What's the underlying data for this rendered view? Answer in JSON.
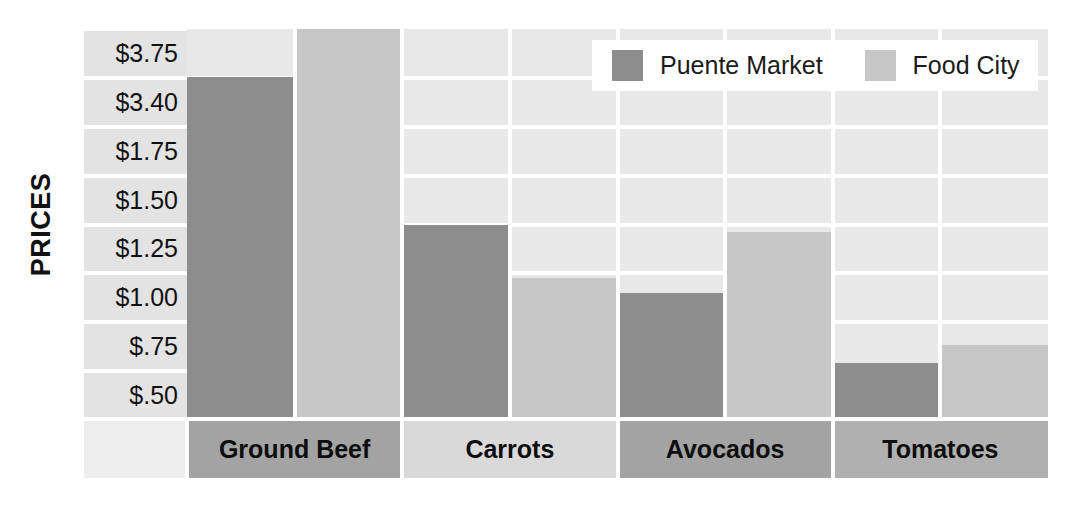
{
  "axis": {
    "y_title": "PRICES",
    "y_ticks": [
      "$3.75",
      "$3.40",
      "$1.75",
      "$1.50",
      "$1.25",
      "$1.00",
      "$.75",
      "$.50"
    ]
  },
  "legend": {
    "items": [
      {
        "label": "Puente Market",
        "color": "#8d8d8d",
        "swatch_name": "legend-swatch-puente-market"
      },
      {
        "label": "Food City",
        "color": "#c6c6c6",
        "swatch_name": "legend-swatch-food-city"
      }
    ]
  },
  "colors": {
    "series_puente_market": "#8d8d8d",
    "series_food_city": "#c6c6c6",
    "plot_background": "#e8e8e8",
    "tick_band": "#e3e3e3",
    "gridline": "#ffffff",
    "text": "#111111"
  },
  "categories": [
    "Ground Beef",
    "Carrots",
    "Avocados",
    "Tomatoes"
  ],
  "chart_data": {
    "type": "bar",
    "title": "",
    "xlabel": "",
    "ylabel": "PRICES",
    "categories": [
      "Ground Beef",
      "Carrots",
      "Avocados",
      "Tomatoes"
    ],
    "tick_labels": [
      "$3.75",
      "$3.40",
      "$1.75",
      "$1.50",
      "$1.25",
      "$1.00",
      "$.75",
      "$.50"
    ],
    "grid": true,
    "legend_position": "top-right",
    "series": [
      {
        "name": "Puente Market",
        "color": "#8d8d8d",
        "values": [
          3.4,
          1.35,
          1.05,
          0.7
        ],
        "value_labels": [
          "$3.40",
          "$1.35",
          "$1.05",
          "$.70"
        ]
      },
      {
        "name": "Food City",
        "color": "#c6c6c6",
        "values": [
          3.75,
          1.1,
          1.3,
          0.78
        ],
        "value_labels": [
          "$3.75",
          "$1.10",
          "$1.30",
          "$.78"
        ]
      }
    ]
  },
  "bar_geometry": {
    "note": "bar top offsets in px measured from top of plot area (height 391)",
    "bars": [
      {
        "category": "Ground Beef",
        "series": "Puente Market",
        "top": 48,
        "style": "s0"
      },
      {
        "category": "Ground Beef",
        "series": "Food City",
        "top": 0,
        "style": "s1"
      },
      {
        "category": "Carrots",
        "series": "Puente Market",
        "top": 196,
        "style": "s0"
      },
      {
        "category": "Carrots",
        "series": "Food City",
        "top": 249,
        "style": "s1"
      },
      {
        "category": "Avocados",
        "series": "Puente Market",
        "top": 264,
        "style": "s0"
      },
      {
        "category": "Avocados",
        "series": "Food City",
        "top": 203,
        "style": "s1"
      },
      {
        "category": "Tomatoes",
        "series": "Puente Market",
        "top": 334,
        "style": "s0"
      },
      {
        "category": "Tomatoes",
        "series": "Food City",
        "top": 316,
        "style": "s1"
      }
    ]
  }
}
